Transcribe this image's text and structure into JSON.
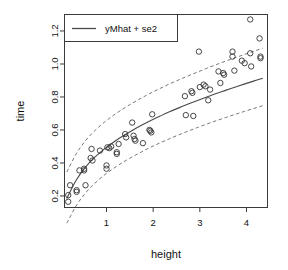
{
  "chart_data": {
    "type": "scatter",
    "title": "",
    "xlabel": "height",
    "ylabel": "time",
    "xlim": [
      0.1,
      4.45
    ],
    "ylim": [
      0.13,
      1.3
    ],
    "xticks": [
      1,
      2,
      3,
      4
    ],
    "xtick_labels": [
      "1",
      "2",
      "3",
      "4"
    ],
    "yticks": [
      0.2,
      0.4,
      0.6,
      0.8,
      1.0,
      1.2
    ],
    "ytick_labels": [
      "0.2",
      "0.4",
      "0.6",
      "0.8",
      "1.0",
      "1.2"
    ],
    "grid": false,
    "legend": {
      "position": "top-left",
      "entries": [
        {
          "label": "yMhat + se2",
          "marker": "line",
          "color": "#4a4a4a"
        }
      ]
    },
    "point_marker": "open-circle",
    "point_color": "#333333",
    "points": [
      {
        "x": 0.18,
        "y": 0.205
      },
      {
        "x": 0.18,
        "y": 0.165
      },
      {
        "x": 0.22,
        "y": 0.265
      },
      {
        "x": 0.36,
        "y": 0.235
      },
      {
        "x": 0.36,
        "y": 0.225
      },
      {
        "x": 0.42,
        "y": 0.355
      },
      {
        "x": 0.52,
        "y": 0.365
      },
      {
        "x": 0.52,
        "y": 0.355
      },
      {
        "x": 0.55,
        "y": 0.265
      },
      {
        "x": 0.66,
        "y": 0.43
      },
      {
        "x": 0.68,
        "y": 0.485
      },
      {
        "x": 0.7,
        "y": 0.415
      },
      {
        "x": 0.86,
        "y": 0.475
      },
      {
        "x": 1.0,
        "y": 0.385
      },
      {
        "x": 1.0,
        "y": 0.365
      },
      {
        "x": 1.02,
        "y": 0.495
      },
      {
        "x": 1.06,
        "y": 0.49
      },
      {
        "x": 1.1,
        "y": 0.5
      },
      {
        "x": 1.22,
        "y": 0.465
      },
      {
        "x": 1.22,
        "y": 0.455
      },
      {
        "x": 1.26,
        "y": 0.515
      },
      {
        "x": 1.4,
        "y": 0.575
      },
      {
        "x": 1.42,
        "y": 0.555
      },
      {
        "x": 1.55,
        "y": 0.645
      },
      {
        "x": 1.58,
        "y": 0.565
      },
      {
        "x": 1.6,
        "y": 0.545
      },
      {
        "x": 1.62,
        "y": 0.535
      },
      {
        "x": 1.78,
        "y": 0.52
      },
      {
        "x": 1.92,
        "y": 0.6
      },
      {
        "x": 1.94,
        "y": 0.595
      },
      {
        "x": 1.96,
        "y": 0.585
      },
      {
        "x": 1.98,
        "y": 0.695
      },
      {
        "x": 2.68,
        "y": 0.805
      },
      {
        "x": 2.7,
        "y": 0.69
      },
      {
        "x": 2.82,
        "y": 0.835
      },
      {
        "x": 2.84,
        "y": 0.825
      },
      {
        "x": 2.86,
        "y": 0.685
      },
      {
        "x": 2.98,
        "y": 1.075
      },
      {
        "x": 3.0,
        "y": 0.86
      },
      {
        "x": 3.08,
        "y": 0.875
      },
      {
        "x": 3.12,
        "y": 0.865
      },
      {
        "x": 3.18,
        "y": 0.78
      },
      {
        "x": 3.22,
        "y": 0.845
      },
      {
        "x": 3.4,
        "y": 0.955
      },
      {
        "x": 3.44,
        "y": 0.885
      },
      {
        "x": 3.5,
        "y": 0.945
      },
      {
        "x": 3.52,
        "y": 0.935
      },
      {
        "x": 3.7,
        "y": 1.075
      },
      {
        "x": 3.7,
        "y": 1.045
      },
      {
        "x": 3.74,
        "y": 0.96
      },
      {
        "x": 3.9,
        "y": 1.02
      },
      {
        "x": 3.96,
        "y": 1.005
      },
      {
        "x": 4.08,
        "y": 1.27
      },
      {
        "x": 4.08,
        "y": 1.065
      },
      {
        "x": 4.1,
        "y": 0.985
      },
      {
        "x": 4.28,
        "y": 1.155
      },
      {
        "x": 4.3,
        "y": 1.045
      },
      {
        "x": 4.3,
        "y": 1.035
      }
    ],
    "series": [
      {
        "name": "yMhat",
        "style": "solid",
        "color": "#4a4a4a",
        "x": [
          0.15,
          0.35,
          0.55,
          0.75,
          0.95,
          1.15,
          1.35,
          1.55,
          1.75,
          1.95,
          2.15,
          2.35,
          2.55,
          2.75,
          2.95,
          3.15,
          3.35,
          3.55,
          3.75,
          3.95,
          4.15,
          4.35
        ],
        "y": [
          0.185,
          0.295,
          0.375,
          0.435,
          0.484,
          0.526,
          0.563,
          0.597,
          0.628,
          0.657,
          0.684,
          0.71,
          0.734,
          0.757,
          0.779,
          0.8,
          0.821,
          0.84,
          0.859,
          0.878,
          0.896,
          0.913
        ]
      },
      {
        "name": "yMhat + se2",
        "style": "dashed",
        "color": "#6a6a6a",
        "x": [
          0.15,
          0.35,
          0.55,
          0.75,
          0.95,
          1.15,
          1.35,
          1.55,
          1.75,
          1.95,
          2.15,
          2.35,
          2.55,
          2.75,
          2.95,
          3.15,
          3.35,
          3.55,
          3.75,
          3.95,
          4.15,
          4.35
        ],
        "y": [
          0.345,
          0.455,
          0.535,
          0.596,
          0.646,
          0.689,
          0.727,
          0.762,
          0.794,
          0.824,
          0.852,
          0.879,
          0.904,
          0.928,
          0.951,
          0.974,
          0.996,
          1.017,
          1.037,
          1.057,
          1.077,
          1.096
        ]
      },
      {
        "name": "yMhat - se2",
        "style": "dashed",
        "color": "#6a6a6a",
        "x": [
          0.15,
          0.35,
          0.55,
          0.75,
          0.95,
          1.15,
          1.35,
          1.55,
          1.75,
          1.95,
          2.15,
          2.35,
          2.55,
          2.75,
          2.95,
          3.15,
          3.35,
          3.55,
          3.75,
          3.95,
          4.15,
          4.35
        ],
        "y": [
          0.035,
          0.14,
          0.218,
          0.277,
          0.326,
          0.367,
          0.404,
          0.437,
          0.467,
          0.496,
          0.522,
          0.547,
          0.571,
          0.593,
          0.615,
          0.636,
          0.656,
          0.675,
          0.694,
          0.712,
          0.73,
          0.747
        ]
      }
    ]
  }
}
